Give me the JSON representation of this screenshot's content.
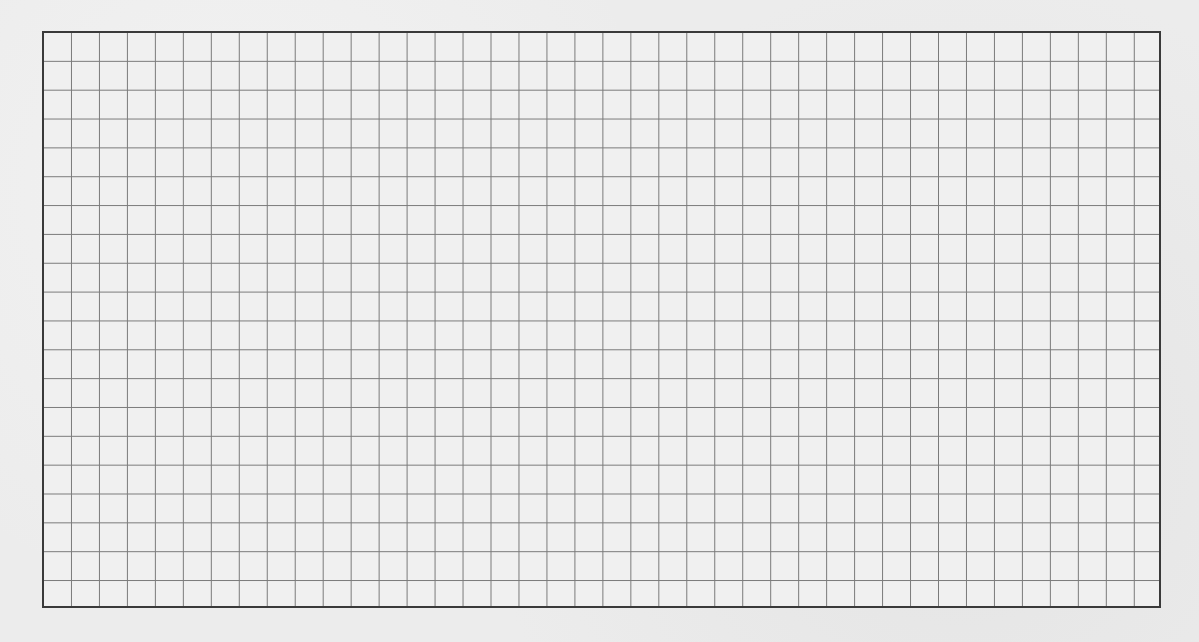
{
  "image": {
    "description": "Scanned sheet of grid paper",
    "grid": {
      "columns": 40,
      "rows": 20
    },
    "colors": {
      "paper": "#ececec",
      "grid_line": "#7a7a7a",
      "border": "#3a3a3a"
    }
  }
}
